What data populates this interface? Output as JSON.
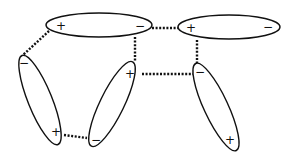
{
  "diagram": {
    "title": "",
    "dipoles": [
      {
        "id": "A",
        "cx": 99,
        "cy": 25,
        "rx": 53,
        "ry": 12,
        "rot": 0,
        "pos": {
          "label": "+",
          "x": 61,
          "y": 26
        },
        "neg": {
          "label": "−",
          "x": 140,
          "y": 26
        }
      },
      {
        "id": "B",
        "cx": 229,
        "cy": 27,
        "rx": 51,
        "ry": 12,
        "rot": 0,
        "pos": {
          "label": "+",
          "x": 191,
          "y": 28
        },
        "neg": {
          "label": "−",
          "x": 268,
          "y": 27
        }
      },
      {
        "id": "C",
        "cx": 40,
        "cy": 100,
        "rx": 12,
        "ry": 48,
        "rot": -22,
        "neg": {
          "label": "−",
          "x": 24,
          "y": 63
        },
        "pos": {
          "label": "+",
          "x": 56,
          "y": 132
        }
      },
      {
        "id": "D",
        "cx": 112,
        "cy": 104,
        "rx": 12,
        "ry": 47,
        "rot": 26,
        "pos": {
          "label": "+",
          "x": 130,
          "y": 74
        },
        "neg": {
          "label": "−",
          "x": 96,
          "y": 140
        }
      },
      {
        "id": "E",
        "cx": 216,
        "cy": 107,
        "rx": 12,
        "ry": 48,
        "rot": -25,
        "neg": {
          "label": "−",
          "x": 200,
          "y": 72
        },
        "pos": {
          "label": "+",
          "x": 230,
          "y": 140
        }
      }
    ],
    "dotted_links": [
      {
        "from": "A+",
        "to": "C-",
        "x1": 49,
        "y1": 31,
        "x2": 23,
        "y2": 55
      },
      {
        "from": "A-",
        "to": "D+",
        "x1": 135,
        "y1": 37,
        "x2": 135,
        "y2": 61
      },
      {
        "from": "A-",
        "to": "B+",
        "x1": 152,
        "y1": 28,
        "x2": 178,
        "y2": 28
      },
      {
        "from": "B+",
        "to": "E-",
        "x1": 197,
        "y1": 40,
        "x2": 197,
        "y2": 63
      },
      {
        "from": "D+",
        "to": "E-",
        "x1": 142,
        "y1": 74,
        "x2": 193,
        "y2": 74
      },
      {
        "from": "C+",
        "to": "D-",
        "x1": 64,
        "y1": 135,
        "x2": 87,
        "y2": 138
      }
    ],
    "colors": {
      "stroke": "#111111",
      "background": "#ffffff"
    }
  }
}
